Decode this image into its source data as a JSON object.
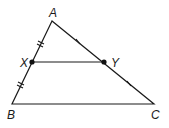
{
  "diagram": {
    "type": "triangle-midsegment",
    "points": {
      "A": {
        "label": "A",
        "x": 52,
        "y": 21
      },
      "B": {
        "label": "B",
        "x": 12,
        "y": 104
      },
      "C": {
        "label": "C",
        "x": 154,
        "y": 104
      },
      "X": {
        "label": "X",
        "x": 32,
        "y": 62
      },
      "Y": {
        "label": "Y",
        "x": 104,
        "y": 62
      }
    },
    "segments": [
      "AB",
      "AC",
      "BC",
      "XY"
    ],
    "tick_marks": {
      "AX": 2,
      "XB": 2,
      "AY": 1,
      "YC": 1
    },
    "colors": {
      "stroke": "#1a1a1a",
      "background": "#ffffff"
    }
  }
}
